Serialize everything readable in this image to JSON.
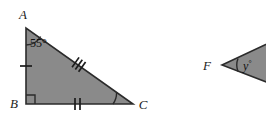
{
  "figure": {
    "background_color": "#ffffff",
    "fill_color": "#8a8a8a",
    "stroke_color": "#2b2b2b",
    "label_color": "#1c1c1c",
    "shapes": [
      {
        "name": "right-triangle-ABC",
        "type": "triangle",
        "vertices": [
          {
            "label": "A",
            "x": 26,
            "y": 28
          },
          {
            "label": "B",
            "x": 26,
            "y": 104
          },
          {
            "label": "C",
            "x": 133,
            "y": 104
          }
        ],
        "right_angle_at": "B",
        "angle_marks": [
          {
            "at": "A",
            "text": "55°",
            "arcs": 1
          },
          {
            "at": "C",
            "text": "",
            "arcs": 1
          }
        ],
        "side_ticks": [
          {
            "side": "AB",
            "count": 1
          },
          {
            "side": "AC",
            "count": 3
          },
          {
            "side": "BC",
            "count": 2
          }
        ]
      },
      {
        "name": "wedge-F",
        "type": "wedge",
        "vertices": [
          {
            "label": "F",
            "x": 222,
            "y": 65
          },
          {
            "label": "",
            "x": 278,
            "y": 35
          },
          {
            "label": "",
            "x": 278,
            "y": 88
          }
        ],
        "angle_marks": [
          {
            "at": "F",
            "text": "y°",
            "arcs": 1
          }
        ],
        "side_ticks": []
      }
    ],
    "labels": {
      "vertex_a": "A",
      "vertex_b": "B",
      "vertex_c": "C",
      "vertex_f": "F",
      "angle_a": "55°",
      "angle_y_value": "y",
      "angle_y_degree": "°"
    }
  }
}
